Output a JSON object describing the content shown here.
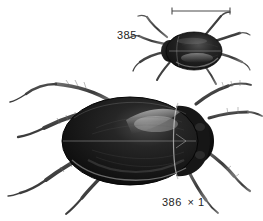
{
  "plate": {
    "background_color": "#ffffff",
    "ink_color": "#1a1a1a",
    "width": 263,
    "height": 221,
    "caption_text_color": "#242424"
  },
  "scale_bar": {
    "name": "scale-bar",
    "x_start": 172,
    "x_end": 230,
    "y": 11,
    "tick_height": 7,
    "color": "#4a4a4a"
  },
  "figures": [
    {
      "number": "385",
      "label": "385",
      "magnification": "",
      "subject": "diving-beetle-dorsal-small",
      "body_fill": "#1a1a1a",
      "highlight": "#c8c8c8"
    },
    {
      "number": "386",
      "label": "386",
      "magnification": "× 1",
      "magnification_symbol": "×",
      "magnification_value": "1",
      "subject": "diving-beetle-dorsal-large",
      "body_fill": "#141414",
      "highlight": "#d2d2d2"
    }
  ],
  "labels": {
    "figure_385": "385",
    "figure_386": "386",
    "figure_386_magnification": "× 1"
  }
}
